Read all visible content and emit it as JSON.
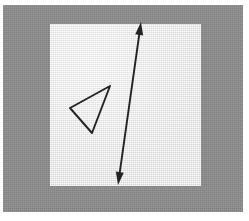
{
  "image": {
    "title": "Hand-drawn geometry figure on light panel",
    "width": 249,
    "height": 221,
    "background_color": "#ffffff"
  },
  "frame": {
    "name": "gray-mount",
    "color": "#8c8c8c",
    "x": 3,
    "y": 5,
    "width": 240,
    "height": 207
  },
  "panel": {
    "name": "light-drawing-panel",
    "color": "#e7e7e7",
    "x": 50,
    "y": 24,
    "width": 151,
    "height": 162
  },
  "ink": {
    "color": "#232323",
    "stroke_width": 1.9
  },
  "shapes": [
    {
      "name": "triangle",
      "type": "polygon",
      "closed": true,
      "points": [
        [
          110,
          86
        ],
        [
          70,
          108
        ],
        [
          92,
          133
        ]
      ]
    },
    {
      "name": "double-headed-arrow",
      "type": "line",
      "start": [
        118,
        185
      ],
      "end": [
        141,
        22
      ],
      "arrowhead_start": true,
      "arrowhead_end": true,
      "arrow_length": 13,
      "arrow_half_width": 4
    }
  ]
}
